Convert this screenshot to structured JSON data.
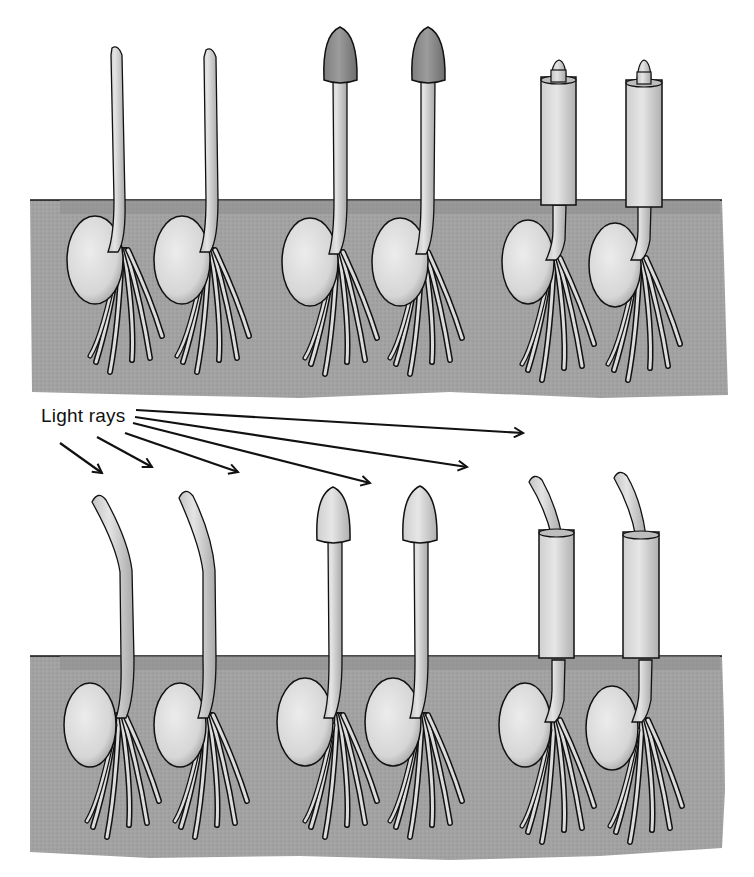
{
  "figure": {
    "label": "Light rays",
    "colors": {
      "soil": "#a2a2a2",
      "seedling": "#dcdcdc",
      "seed": "#e2e2e2",
      "cap_dark": "#8e8e8e",
      "cap_light": "#d6d6d6",
      "cylinder": "#dadada",
      "outline": "#111111"
    },
    "panels": [
      {
        "name": "no-light-panel",
        "seedlings": [
          {
            "type": "intact-tip"
          },
          {
            "type": "intact-tip"
          },
          {
            "type": "opaque-cap"
          },
          {
            "type": "opaque-cap"
          },
          {
            "type": "opaque-collar"
          },
          {
            "type": "opaque-collar"
          }
        ]
      },
      {
        "name": "unilateral-light-panel",
        "seedlings": [
          {
            "type": "intact-tip",
            "bent": true
          },
          {
            "type": "intact-tip",
            "bent": true
          },
          {
            "type": "translucent-cap",
            "bent": false
          },
          {
            "type": "translucent-cap",
            "bent": false
          },
          {
            "type": "opaque-collar",
            "bent": true
          },
          {
            "type": "opaque-collar",
            "bent": true
          }
        ]
      }
    ]
  }
}
